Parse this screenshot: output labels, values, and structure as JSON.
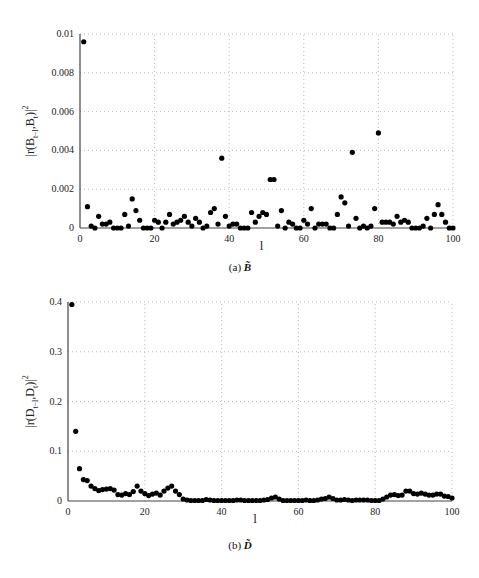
{
  "chart_data": [
    {
      "type": "scatter",
      "title": "",
      "caption": "(a) B̃",
      "xlabel": "l",
      "ylabel": "|r(B_{t-l},B_t)|^2",
      "xlim": [
        0,
        100
      ],
      "ylim": [
        0,
        0.01
      ],
      "xticks": [
        0,
        20,
        40,
        60,
        80,
        100
      ],
      "yticks": [
        0,
        0.002,
        0.004,
        0.006,
        0.008,
        0.01
      ],
      "ytick_labels": [
        "0",
        "0.002",
        "0.004",
        "0.006",
        "0.008",
        "0.01"
      ],
      "grid": true,
      "x": [
        1,
        2,
        3,
        4,
        5,
        6,
        7,
        8,
        9,
        10,
        11,
        12,
        13,
        14,
        15,
        16,
        17,
        18,
        19,
        20,
        21,
        22,
        23,
        24,
        25,
        26,
        27,
        28,
        29,
        30,
        31,
        32,
        33,
        34,
        35,
        36,
        37,
        38,
        39,
        40,
        41,
        42,
        43,
        44,
        45,
        46,
        47,
        48,
        49,
        50,
        51,
        52,
        53,
        54,
        55,
        56,
        57,
        58,
        59,
        60,
        61,
        62,
        63,
        64,
        65,
        66,
        67,
        68,
        69,
        70,
        71,
        72,
        73,
        74,
        75,
        76,
        77,
        78,
        79,
        80,
        81,
        82,
        83,
        84,
        85,
        86,
        87,
        88,
        89,
        90,
        91,
        92,
        93,
        94,
        95,
        96,
        97,
        98,
        99,
        100
      ],
      "values": [
        0.0096,
        0.0011,
        0.0001,
        0.0,
        0.0006,
        0.0002,
        0.0002,
        0.0003,
        0.0,
        0.0,
        0.0,
        0.0007,
        0.0001,
        0.0015,
        0.0009,
        0.0004,
        0.0,
        0.0,
        0.0,
        0.0004,
        0.0003,
        0.0,
        0.0003,
        0.0007,
        0.0002,
        0.0003,
        0.0004,
        0.0006,
        0.0003,
        0.0001,
        0.0005,
        0.0003,
        0.0,
        0.0001,
        0.0008,
        0.001,
        0.0002,
        0.0036,
        0.0006,
        0.0001,
        0.0002,
        0.0002,
        0.0,
        0.0,
        0.0,
        0.0008,
        0.0003,
        0.0006,
        0.0008,
        0.0007,
        0.0025,
        0.0025,
        0.0001,
        0.0009,
        0.0,
        0.0003,
        0.0002,
        0.0,
        0.0,
        0.0004,
        0.0002,
        0.001,
        0.0,
        0.0002,
        0.0002,
        0.0002,
        0.0,
        0.0,
        0.0007,
        0.0016,
        0.0013,
        0.0001,
        0.0039,
        0.0005,
        0.0,
        0.0001,
        0.0,
        0.0001,
        0.001,
        0.0049,
        0.0003,
        0.0003,
        0.0003,
        0.0002,
        0.0006,
        0.0003,
        0.0004,
        0.0003,
        0.0,
        0.0,
        0.0,
        0.0001,
        0.0005,
        0.0,
        0.0007,
        0.0012,
        0.0007,
        0.0003,
        0.0,
        0.0
      ]
    },
    {
      "type": "scatter",
      "title": "",
      "caption": "(b) D̃",
      "xlabel": "l",
      "ylabel": "|r(D_{t-l},D_t)|^2",
      "xlim": [
        0,
        100
      ],
      "ylim": [
        0,
        0.4
      ],
      "xticks": [
        0,
        20,
        40,
        60,
        80,
        100
      ],
      "yticks": [
        0,
        0.1,
        0.2,
        0.3,
        0.4
      ],
      "ytick_labels": [
        "0",
        "0.1",
        "0.2",
        "0.3",
        "0.4"
      ],
      "grid": true,
      "x": [
        1,
        2,
        3,
        4,
        5,
        6,
        7,
        8,
        9,
        10,
        11,
        12,
        13,
        14,
        15,
        16,
        17,
        18,
        19,
        20,
        21,
        22,
        23,
        24,
        25,
        26,
        27,
        28,
        29,
        30,
        31,
        32,
        33,
        34,
        35,
        36,
        37,
        38,
        39,
        40,
        41,
        42,
        43,
        44,
        45,
        46,
        47,
        48,
        49,
        50,
        51,
        52,
        53,
        54,
        55,
        56,
        57,
        58,
        59,
        60,
        61,
        62,
        63,
        64,
        65,
        66,
        67,
        68,
        69,
        70,
        71,
        72,
        73,
        74,
        75,
        76,
        77,
        78,
        79,
        80,
        81,
        82,
        83,
        84,
        85,
        86,
        87,
        88,
        89,
        90,
        91,
        92,
        93,
        94,
        95,
        96,
        97,
        98,
        99,
        100
      ],
      "values": [
        0.395,
        0.14,
        0.065,
        0.043,
        0.041,
        0.03,
        0.025,
        0.021,
        0.023,
        0.024,
        0.025,
        0.022,
        0.013,
        0.012,
        0.015,
        0.013,
        0.019,
        0.03,
        0.02,
        0.015,
        0.011,
        0.014,
        0.016,
        0.012,
        0.02,
        0.026,
        0.03,
        0.02,
        0.013,
        0.004,
        0.002,
        0.001,
        0.001,
        0.001,
        0.001,
        0.003,
        0.002,
        0.001,
        0.001,
        0.001,
        0.001,
        0.001,
        0.001,
        0.002,
        0.002,
        0.001,
        0.001,
        0.001,
        0.001,
        0.001,
        0.002,
        0.003,
        0.006,
        0.008,
        0.004,
        0.001,
        0.001,
        0.001,
        0.001,
        0.001,
        0.001,
        0.002,
        0.001,
        0.001,
        0.002,
        0.004,
        0.005,
        0.008,
        0.005,
        0.002,
        0.002,
        0.003,
        0.002,
        0.001,
        0.002,
        0.002,
        0.002,
        0.002,
        0.001,
        0.001,
        0.001,
        0.004,
        0.008,
        0.012,
        0.013,
        0.011,
        0.012,
        0.02,
        0.02,
        0.015,
        0.014,
        0.016,
        0.014,
        0.012,
        0.012,
        0.014,
        0.014,
        0.01,
        0.009,
        0.006
      ]
    }
  ]
}
